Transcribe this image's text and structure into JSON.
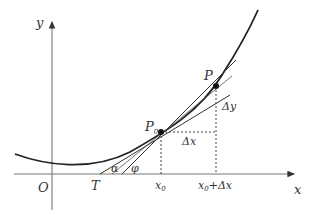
{
  "diagram": {
    "axes": {
      "x_label": "x",
      "y_label": "y",
      "origin_label": "O"
    },
    "points": {
      "p0_label": "P",
      "p0_sub": "0",
      "p_label": "P",
      "t_label": "T"
    },
    "angles": {
      "alpha": "α",
      "phi": "φ"
    },
    "increments": {
      "dx": "Δx",
      "dy": "Δy"
    },
    "ticks": {
      "x0_main": "x",
      "x0_sub": "0",
      "x0dx_main": "x",
      "x0dx_sub": "0",
      "x0dx_rest": "+Δx"
    }
  }
}
